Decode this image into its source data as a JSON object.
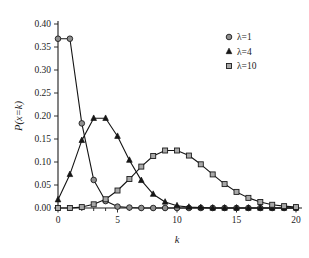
{
  "chart_data": {
    "type": "line",
    "title": "",
    "subtitle": "",
    "xlabel": "k",
    "ylabel": "P(x=k)",
    "xlim": [
      0,
      20
    ],
    "ylim": [
      0.0,
      0.4
    ],
    "grid": false,
    "legend_position": "top-right",
    "x": [
      0,
      1,
      2,
      3,
      4,
      5,
      6,
      7,
      8,
      9,
      10,
      11,
      12,
      13,
      14,
      15,
      16,
      17,
      18,
      19,
      20
    ],
    "x_tick_labels": [
      "0",
      "5",
      "10",
      "15",
      "20"
    ],
    "x_tick_values": [
      0,
      5,
      10,
      15,
      20
    ],
    "x_minor_tick_values": [
      0,
      1,
      2,
      3,
      4,
      5,
      6,
      7,
      8,
      9,
      10,
      11,
      12,
      13,
      14,
      15,
      16,
      17,
      18,
      19,
      20
    ],
    "y_tick_labels": [
      "0.00",
      "0.05",
      "0.10",
      "0.15",
      "0.20",
      "0.25",
      "0.30",
      "0.35",
      "0.40"
    ],
    "y_tick_values": [
      0.0,
      0.05,
      0.1,
      0.15,
      0.2,
      0.25,
      0.3,
      0.35,
      0.4
    ],
    "series": [
      {
        "name": "λ=1",
        "marker": "circle",
        "marker_fill": "#8f8f8f",
        "line_color": "#141414",
        "values": [
          0.368,
          0.368,
          0.184,
          0.061,
          0.015,
          0.003,
          0.001,
          0.0,
          0.0,
          0.0,
          0.0,
          0.0,
          0.0,
          0.0,
          0.0,
          0.0,
          0.0,
          0.0,
          0.0,
          0.0,
          0.0
        ]
      },
      {
        "name": "λ=4",
        "marker": "triangle",
        "marker_fill": "#161616",
        "line_color": "#141414",
        "values": [
          0.018,
          0.073,
          0.147,
          0.195,
          0.195,
          0.156,
          0.104,
          0.06,
          0.03,
          0.013,
          0.005,
          0.002,
          0.001,
          0.0,
          0.0,
          0.0,
          0.0,
          0.0,
          0.0,
          0.0,
          0.0
        ]
      },
      {
        "name": "λ=10",
        "marker": "square",
        "marker_fill": "#a8a8a8",
        "line_color": "#141414",
        "values": [
          0.0,
          0.0,
          0.002,
          0.008,
          0.019,
          0.038,
          0.063,
          0.09,
          0.113,
          0.125,
          0.125,
          0.114,
          0.095,
          0.073,
          0.052,
          0.035,
          0.022,
          0.013,
          0.007,
          0.004,
          0.002
        ]
      }
    ]
  },
  "legend": {
    "entries": [
      {
        "label": "λ=1"
      },
      {
        "label": "λ=4"
      },
      {
        "label": "λ=10"
      }
    ]
  },
  "axes": {
    "x_title": "k",
    "y_title": "P(x=k)"
  }
}
